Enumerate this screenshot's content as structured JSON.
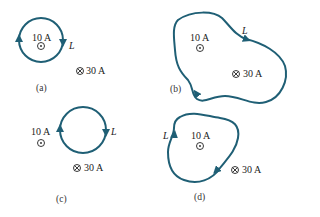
{
  "colors": {
    "loop": "#1f5f75",
    "text": "#222222",
    "background": "#ffffff"
  },
  "panels": [
    {
      "id": "a",
      "caption": "(a)",
      "loop_label": "L",
      "current_out": "10 A",
      "current_in": "30 A",
      "loop_shape": "circle",
      "encloses": [
        "10 A"
      ]
    },
    {
      "id": "b",
      "caption": "(b)",
      "loop_label": "L",
      "current_out": "10 A",
      "current_in": "30 A",
      "loop_shape": "irregular",
      "encloses": [
        "10 A",
        "30 A"
      ]
    },
    {
      "id": "c",
      "caption": "(c)",
      "loop_label": "L",
      "current_out": "10 A",
      "current_in": "30 A",
      "loop_shape": "circle",
      "encloses": []
    },
    {
      "id": "d",
      "caption": "(d)",
      "loop_label": "L",
      "current_out": "10 A",
      "current_in": "30 A",
      "loop_shape": "irregular",
      "encloses": [
        "10 A"
      ]
    }
  ],
  "symbols": {
    "out_of_page": "dot-in-circle",
    "into_page": "cross-in-circle"
  }
}
